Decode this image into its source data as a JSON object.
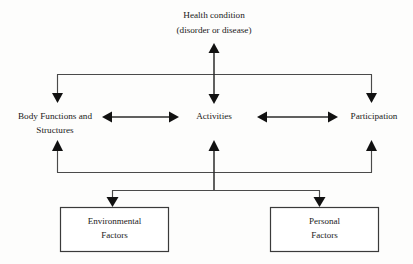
{
  "diagram": {
    "background_color": "#fdfdfc",
    "line_color": "#4a4a4a",
    "text_color": "#1a1a1a",
    "box_border_color": "#3a3a3a",
    "nodes": {
      "health_condition": {
        "line1": "Health condition",
        "line2": "(disorder or disease)"
      },
      "body_functions": {
        "line1": "Body Functions and",
        "line2": "Structures"
      },
      "activities": {
        "line1": "Activities"
      },
      "participation": {
        "line1": "Participation"
      },
      "environmental_factors": {
        "line1": "Environmental",
        "line2": "Factors"
      },
      "personal_factors": {
        "line1": "Personal",
        "line2": "Factors"
      }
    }
  }
}
